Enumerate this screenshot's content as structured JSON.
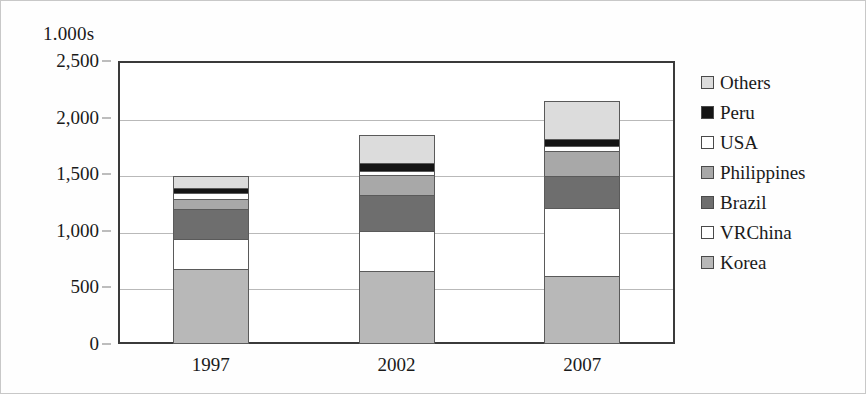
{
  "chart_data": {
    "type": "bar",
    "stacked": true,
    "title": "",
    "unit_caption": "1.000s",
    "xlabel": "",
    "ylabel": "",
    "categories": [
      "1997",
      "2002",
      "2007"
    ],
    "ylim": [
      0,
      2500
    ],
    "yticks": [
      0,
      500,
      1000,
      1500,
      2000,
      2500
    ],
    "ytick_labels": [
      "0",
      "500",
      "1,000",
      "1,500",
      "2,000",
      "2,500"
    ],
    "grid": true,
    "legend_position": "right",
    "stack_order_bottom_to_top": [
      "Korea",
      "VRChina",
      "Brazil",
      "Philippines",
      "USA",
      "Peru",
      "Others"
    ],
    "series": [
      {
        "name": "Korea",
        "color": "#b8b8b8",
        "values": [
          665,
          645,
          600
        ]
      },
      {
        "name": "VRChina",
        "color": "#ffffff",
        "values": [
          265,
          350,
          600
        ]
      },
      {
        "name": "Brazil",
        "color": "#6e6e6e",
        "values": [
          265,
          325,
          285
        ]
      },
      {
        "name": "Philippines",
        "color": "#a8a8a8",
        "values": [
          90,
          175,
          220
        ]
      },
      {
        "name": "USA",
        "color": "#ffffff",
        "values": [
          45,
          35,
          45
        ]
      },
      {
        "name": "Peru",
        "color": "#141414",
        "values": [
          45,
          70,
          60
        ]
      },
      {
        "name": "Others",
        "color": "#dcdcdc",
        "values": [
          110,
          245,
          335
        ]
      }
    ],
    "totals": [
      1485,
      1845,
      2145
    ]
  },
  "legend": {
    "entries": [
      {
        "label": "Others",
        "color": "#dcdcdc"
      },
      {
        "label": "Peru",
        "color": "#141414"
      },
      {
        "label": "USA",
        "color": "#ffffff"
      },
      {
        "label": "Philippines",
        "color": "#a8a8a8"
      },
      {
        "label": "Brazil",
        "color": "#6e6e6e"
      },
      {
        "label": "VRChina",
        "color": "#ffffff"
      },
      {
        "label": "Korea",
        "color": "#b8b8b8"
      }
    ]
  }
}
